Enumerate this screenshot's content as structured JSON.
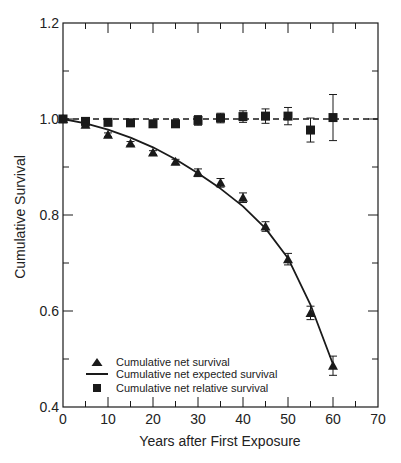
{
  "chart_data": {
    "type": "scatter",
    "title": "",
    "xlabel": "Years after First Exposure",
    "ylabel": "Cumulative Survival",
    "xlim": [
      0,
      70
    ],
    "ylim": [
      0.4,
      1.2
    ],
    "xticks": [
      0,
      10,
      20,
      30,
      40,
      50,
      60,
      70
    ],
    "xtick_labels": [
      "0",
      "10",
      "20",
      "30",
      "40",
      "50",
      "60",
      "70"
    ],
    "yticks": [
      0.4,
      0.6,
      0.8,
      1.0,
      1.2
    ],
    "ytick_labels": [
      "0.4",
      "0.6",
      "0.8",
      "1.0",
      "1.2"
    ],
    "grid": false,
    "legend_position": "lower left",
    "reference_line": {
      "y": 1.0,
      "style": "dashed"
    },
    "x": [
      0,
      5,
      10,
      15,
      20,
      25,
      30,
      35,
      40,
      45,
      50,
      55,
      60
    ],
    "series": [
      {
        "name": "Cumulative net survival",
        "marker": "triangle",
        "values": [
          1.0,
          0.988,
          0.967,
          0.949,
          0.93,
          0.911,
          0.888,
          0.867,
          0.836,
          0.776,
          0.708,
          0.596,
          0.486
        ],
        "errors": [
          0,
          0.004,
          0.004,
          0.004,
          0.004,
          0.005,
          0.008,
          0.009,
          0.01,
          0.01,
          0.012,
          0.014,
          0.02
        ]
      },
      {
        "name": "Cumulative net expected survival",
        "marker": "line",
        "values": [
          1.0,
          0.991,
          0.978,
          0.961,
          0.941,
          0.916,
          0.887,
          0.855,
          0.818,
          0.772,
          0.71,
          0.613,
          0.489
        ]
      },
      {
        "name": "Cumulative net relative survival",
        "marker": "square",
        "values": [
          1.0,
          0.995,
          0.993,
          0.992,
          0.99,
          0.99,
          0.997,
          1.002,
          1.005,
          1.006,
          1.006,
          0.977,
          1.003
        ],
        "errors": [
          0,
          0.004,
          0.004,
          0.004,
          0.004,
          0.006,
          0.01,
          0.01,
          0.012,
          0.015,
          0.018,
          0.025,
          0.048
        ]
      }
    ]
  },
  "legend": {
    "items": [
      {
        "label": "Cumulative net survival",
        "symbol": "triangle"
      },
      {
        "label": "Cumulative net expected survival",
        "symbol": "line"
      },
      {
        "label": "Cumulative net relative survival",
        "symbol": "square"
      }
    ]
  },
  "colors": {
    "ink": "#1a1a1a",
    "background": "#ffffff"
  }
}
